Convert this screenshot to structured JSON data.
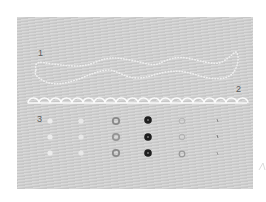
{
  "labels": {
    "label_1": "1",
    "label_2": "2",
    "label_3": "3"
  },
  "colors": {
    "fabric": "#cfcfcf",
    "stitch_light": "#f2f2f2",
    "dark_button": "#1e1e1e",
    "gray_button": "#8a8a8a"
  },
  "sections": [
    {
      "id": 1,
      "description": "dotted wavy outline stitch"
    },
    {
      "id": 2,
      "description": "scalloped edge stitch row"
    },
    {
      "id": 3,
      "description": "grid of eyelet / button stitches in 6 columns x 3 rows"
    }
  ],
  "eyelet_grid": {
    "columns": [
      {
        "style": "faint-light"
      },
      {
        "style": "faint-light"
      },
      {
        "style": "gray-ring"
      },
      {
        "style": "dark-ring"
      },
      {
        "style": "faint-outline"
      },
      {
        "style": "tiny-mark"
      }
    ],
    "rows": 3
  }
}
